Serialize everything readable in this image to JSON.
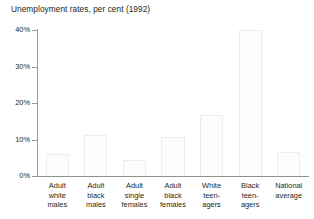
{
  "chart_data": {
    "type": "bar",
    "title": "Unemployment rates, per cent (1992)",
    "xlabel": "",
    "ylabel": "",
    "ylim": [
      0,
      40
    ],
    "grid": false,
    "legend": null,
    "ytick_labels": [
      "40%",
      "30%",
      "20%",
      "10%",
      "0%"
    ],
    "ytick_values": [
      40,
      30,
      20,
      10,
      0
    ],
    "categories": [
      "Adult\nwhite\nmales",
      "Adult\nblack\nmales",
      "Adult\nsingle\nfemales",
      "Adult\nblack\nfemales",
      "White\nteen-\nagers",
      "Black\nteen-\nagers",
      "National\naverage"
    ],
    "values": [
      6.0,
      11.3,
      4.5,
      10.7,
      16.8,
      40.0,
      6.5
    ],
    "bar_fill": "#fdfdfd",
    "bar_stroke": "#ededed",
    "axis_color": "#9a9a9a",
    "text_color": "#231f20"
  }
}
